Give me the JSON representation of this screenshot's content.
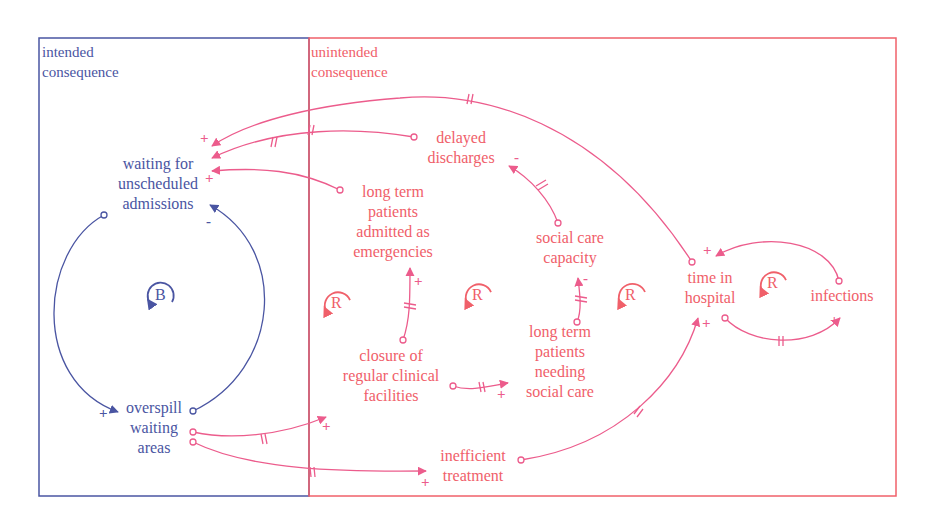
{
  "colors": {
    "intended": "#4a55a2",
    "unintended": "#f0606a",
    "link": "#ec5c8c"
  },
  "regions": {
    "intended": {
      "line1": "intended",
      "line2": "consequence"
    },
    "unintended": {
      "line1": "unintended",
      "line2": "consequence"
    }
  },
  "variables": {
    "waiting": {
      "l1": "waiting for",
      "l2": "unscheduled",
      "l3": "admissions"
    },
    "overspill": {
      "l1": "overspill",
      "l2": "waiting",
      "l3": "areas"
    },
    "delayed": {
      "l1": "delayed",
      "l2": "discharges"
    },
    "ltp_emerg": {
      "l1": "long term",
      "l2": "patients",
      "l3": "admitted as",
      "l4": "emergencies"
    },
    "social_cap": {
      "l1": "social care",
      "l2": "capacity"
    },
    "closure": {
      "l1": "closure of",
      "l2": "regular clinical",
      "l3": "facilities"
    },
    "ltp_social": {
      "l1": "long term",
      "l2": "patients",
      "l3": "needing",
      "l4": "social care"
    },
    "inefficient": {
      "l1": "inefficient",
      "l2": "treatment"
    },
    "time_hosp": {
      "l1": "time in",
      "l2": "hospital"
    },
    "infections": {
      "l1": "infections"
    }
  },
  "loops": {
    "b1": "B",
    "r1": "R",
    "r2": "R",
    "r3": "R",
    "r4": "R"
  },
  "polarities": {
    "plus": "+",
    "minus": "-"
  }
}
